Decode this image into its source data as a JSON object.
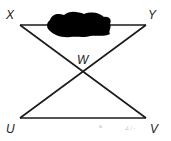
{
  "diagram": {
    "type": "geometry",
    "points": {
      "X": {
        "label": "X",
        "x": 20,
        "y": 25
      },
      "Y": {
        "label": "Y",
        "x": 146,
        "y": 25
      },
      "W": {
        "label": "W",
        "x": 81,
        "y": 72
      },
      "U": {
        "label": "U",
        "x": 20,
        "y": 118
      },
      "V": {
        "label": "V",
        "x": 146,
        "y": 118
      }
    },
    "segments": [
      "XY",
      "UV",
      "XV",
      "YU"
    ],
    "obscured_region": {
      "description": "black blot covering part of segment XY"
    },
    "faint_marks": [
      "a",
      "∠ / -"
    ],
    "colors": {
      "line": "#1a1a1a",
      "blot": "#000000",
      "background": "#ffffff"
    }
  }
}
